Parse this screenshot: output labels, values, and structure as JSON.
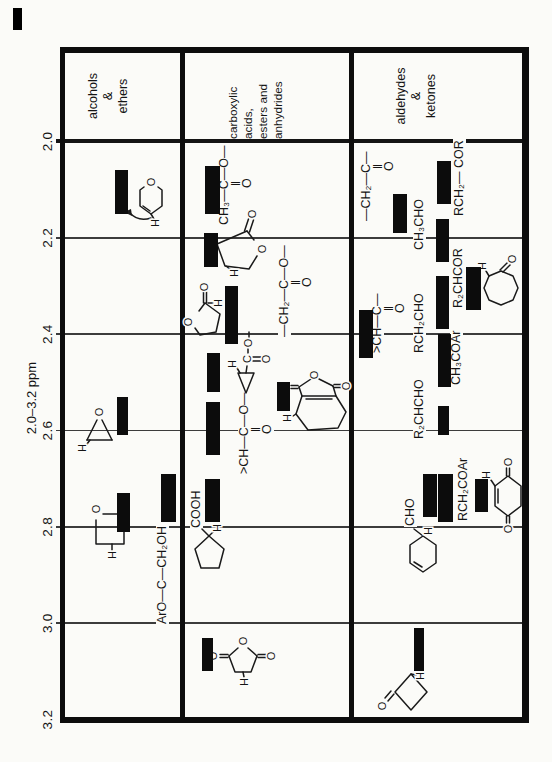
{
  "colors": {
    "paper": "#fbfbf8",
    "ink": "#141414",
    "bar": "#0c0c0c",
    "grid": "#3c3c3c"
  },
  "atoms": {
    "O": "O",
    "H": "H",
    "C": "C"
  },
  "axis": {
    "title": "2.0–3.2 ppm",
    "unit": "ppm",
    "min": 2.0,
    "max": 3.2,
    "x_at_min": 620.5,
    "px_per_ppm": 481.7,
    "ticks": [
      {
        "label": "2.0",
        "ppm": 2.0
      },
      {
        "label": "2.2",
        "ppm": 2.2
      },
      {
        "label": "2.4",
        "ppm": 2.4
      },
      {
        "label": "2.6",
        "ppm": 2.6
      },
      {
        "label": "2.8",
        "ppm": 2.8
      },
      {
        "label": "3.0",
        "ppm": 3.0
      },
      {
        "label": "3.2",
        "ppm": 3.2
      }
    ]
  },
  "rows": [
    {
      "name": "alcohols-ethers",
      "category_lines": [
        "alcohols",
        "&",
        "ethers"
      ],
      "cat_y": 86,
      "align": "center"
    },
    {
      "name": "acids-esters-anhydrides",
      "category_lines": [
        "carboxylic acids,",
        "esters and",
        "anhydrides"
      ],
      "cat_y": 226,
      "align": "left"
    },
    {
      "name": "aldehydes-ketones",
      "category_lines": [
        "aldehydes",
        "&",
        "ketones"
      ],
      "cat_y": 394,
      "align": "center"
    }
  ],
  "formulas": [
    {
      "x": 137,
      "y": 156,
      "lines": [
        {
          "t": "ArO—C—CH₂OH",
          "dx": 0,
          "dy": 0
        }
      ]
    },
    {
      "x": 536,
      "y": 218,
      "lines": [
        {
          "t": "CH₃—C—O—",
          "dx": 0,
          "dy": 0
        },
        {
          "t": "‖",
          "dx": 39,
          "dy": 12
        },
        {
          "t": "O",
          "dx": 37,
          "dy": 23
        }
      ]
    },
    {
      "x": 424,
      "y": 278,
      "lines": [
        {
          "t": "—CH₂—C—O—",
          "dx": 0,
          "dy": 0
        },
        {
          "t": "‖",
          "dx": 52,
          "dy": 12
        },
        {
          "t": "O",
          "dx": 50,
          "dy": 23
        }
      ]
    },
    {
      "x": 287,
      "y": 238,
      "lines": [
        {
          "t": ">CH—C—O—",
          "dx": 0,
          "dy": 0
        },
        {
          "t": "‖",
          "dx": 42,
          "dy": 12
        },
        {
          "t": "O",
          "dx": 40,
          "dy": 23
        }
      ]
    },
    {
      "x": 233,
      "y": 190,
      "lines": [
        {
          "t": "COOH",
          "dx": 0,
          "dy": 0
        }
      ]
    },
    {
      "x": 540,
      "y": 360,
      "lines": [
        {
          "t": "—CH₂—C—",
          "dx": 0,
          "dy": 0
        },
        {
          "t": "‖",
          "dx": 52,
          "dy": 12
        },
        {
          "t": "O",
          "dx": 50,
          "dy": 23
        }
      ]
    },
    {
      "x": 511,
      "y": 413,
      "lines": [
        {
          "t": "CH₃CHO",
          "dx": 0,
          "dy": 0
        }
      ]
    },
    {
      "x": 545,
      "y": 453,
      "lines": [
        {
          "t": "RCH₂— COR",
          "dx": 0,
          "dy": 0
        }
      ]
    },
    {
      "x": 408,
      "y": 371,
      "lines": [
        {
          "t": ">CH—C—",
          "dx": 0,
          "dy": 0
        },
        {
          "t": "‖",
          "dx": 42,
          "dy": 12
        },
        {
          "t": "O",
          "dx": 40,
          "dy": 23
        }
      ]
    },
    {
      "x": 408,
      "y": 413,
      "lines": [
        {
          "t": "RCH₂CHO",
          "dx": 0,
          "dy": 0
        }
      ]
    },
    {
      "x": 453,
      "y": 452,
      "lines": [
        {
          "t": "R₂CHCOR",
          "dx": 0,
          "dy": 0
        }
      ]
    },
    {
      "x": 376,
      "y": 450,
      "lines": [
        {
          "t": "CH₃COAr",
          "dx": 0,
          "dy": 0
        }
      ]
    },
    {
      "x": 322,
      "y": 413,
      "lines": [
        {
          "t": "R₂CHCHO",
          "dx": 0,
          "dy": 0
        }
      ]
    },
    {
      "x": 240,
      "y": 457,
      "lines": [
        {
          "t": "RCH₂COAr",
          "dx": 0,
          "dy": 0
        }
      ]
    },
    {
      "x": 235,
      "y": 404,
      "lines": [
        {
          "t": "CHO",
          "dx": 0,
          "dy": 0
        }
      ]
    }
  ],
  "chart_data": {
    "type": "bar",
    "subtype": "chemical-shift range chart (page printed rotated 90°)",
    "title": "2.0–3.2 ppm",
    "xlabel": "ppm",
    "axis_range": [
      2.0,
      3.2
    ],
    "grid": true,
    "rows": [
      {
        "category": "alcohols & ethers",
        "entries": [
          {
            "label": "dihydropyran ring H (structure)",
            "ppm": [
              2.06,
              2.15
            ],
            "lane_y": 115,
            "bar_h": 13
          },
          {
            "label": "epoxide ring H (structure)",
            "ppm": [
              2.53,
              2.61
            ],
            "lane_y": 117,
            "bar_h": 11
          },
          {
            "label": "ArO—C—CH₂OH",
            "ppm": [
              2.69,
              2.79
            ],
            "lane_y": 161,
            "bar_h": 15
          },
          {
            "label": "oxetane β-CH₂ (structure)",
            "ppm": [
              2.73,
              2.81
            ],
            "lane_y": 117,
            "bar_h": 13
          }
        ]
      },
      {
        "category": "carboxylic acids, esters and anhydrides",
        "entries": [
          {
            "label": "CH₃—C(=O)—O—",
            "ppm": [
              2.05,
              2.15
            ],
            "lane_y": 205,
            "bar_h": 15
          },
          {
            "label": "γ-butyrolactone H (structure)",
            "ppm": [
              2.19,
              2.26
            ],
            "lane_y": 204,
            "bar_h": 14
          },
          {
            "label": "—CH₂—C(=O)—O— / lactone α-H (structure)",
            "ppm": [
              2.3,
              2.42
            ],
            "lane_y": 225,
            "bar_h": 13
          },
          {
            "label": "cyclopropyl ester H (structure)",
            "ppm": [
              2.44,
              2.52
            ],
            "lane_y": 207,
            "bar_h": 13
          },
          {
            "label": ">CH—C(=O)—O—",
            "ppm": [
              2.54,
              2.65
            ],
            "lane_y": 206,
            "bar_h": 14
          },
          {
            "label": "cyclohexene dicarboxylic anhydride H (structure)",
            "ppm": [
              2.5,
              2.56
            ],
            "lane_y": 277,
            "bar_h": 13
          },
          {
            "label": "cyclopentane COOH α-H (structure)",
            "ppm": [
              2.7,
              2.79
            ],
            "lane_y": 205,
            "bar_h": 15
          },
          {
            "label": "succinic anhydride CH₂ (structure)",
            "ppm": [
              3.03,
              3.1
            ],
            "lane_y": 202,
            "bar_h": 11
          }
        ]
      },
      {
        "category": "aldehydes & ketones",
        "entries": [
          {
            "label": "RCH₂— COR",
            "ppm": [
              2.04,
              2.13
            ],
            "lane_y": 437,
            "bar_h": 14
          },
          {
            "label": "—CH₂—C(=O)—",
            "ppm": [
              2.11,
              2.19
            ],
            "lane_y": 393,
            "bar_h": 14
          },
          {
            "label": "CH₃CHO",
            "ppm": [
              2.16,
              2.25
            ],
            "lane_y": 436,
            "bar_h": 13
          },
          {
            "label": "R₂CHCOR",
            "ppm": [
              2.26,
              2.35
            ],
            "lane_y": 466,
            "bar_h": 15
          },
          {
            "label": "RCH₂CHO",
            "ppm": [
              2.28,
              2.39
            ],
            "lane_y": 436,
            "bar_h": 13
          },
          {
            "label": ">CH—C(=O)—",
            "ppm": [
              2.35,
              2.45
            ],
            "lane_y": 359,
            "bar_h": 14
          },
          {
            "label": "CH₃COAr",
            "ppm": [
              2.4,
              2.51
            ],
            "lane_y": 438,
            "bar_h": 13
          },
          {
            "label": "R₂CHCHO",
            "ppm": [
              2.55,
              2.61
            ],
            "lane_y": 438,
            "bar_h": 11
          },
          {
            "label": "cyclohexene carbaldehyde H (structure)",
            "ppm": [
              2.69,
              2.78
            ],
            "lane_y": 423,
            "bar_h": 14
          },
          {
            "label": "RCH₂COAr",
            "ppm": [
              2.69,
              2.79
            ],
            "lane_y": 438,
            "bar_h": 15
          },
          {
            "label": "cyclohexene-1,4-dione H (structure)",
            "ppm": [
              2.7,
              2.77
            ],
            "lane_y": 475,
            "bar_h": 13
          },
          {
            "label": "cyclobutanone α-CH₂ (structure)",
            "ppm": [
              3.01,
              3.1
            ],
            "lane_y": 414,
            "bar_h": 10
          }
        ]
      }
    ]
  }
}
